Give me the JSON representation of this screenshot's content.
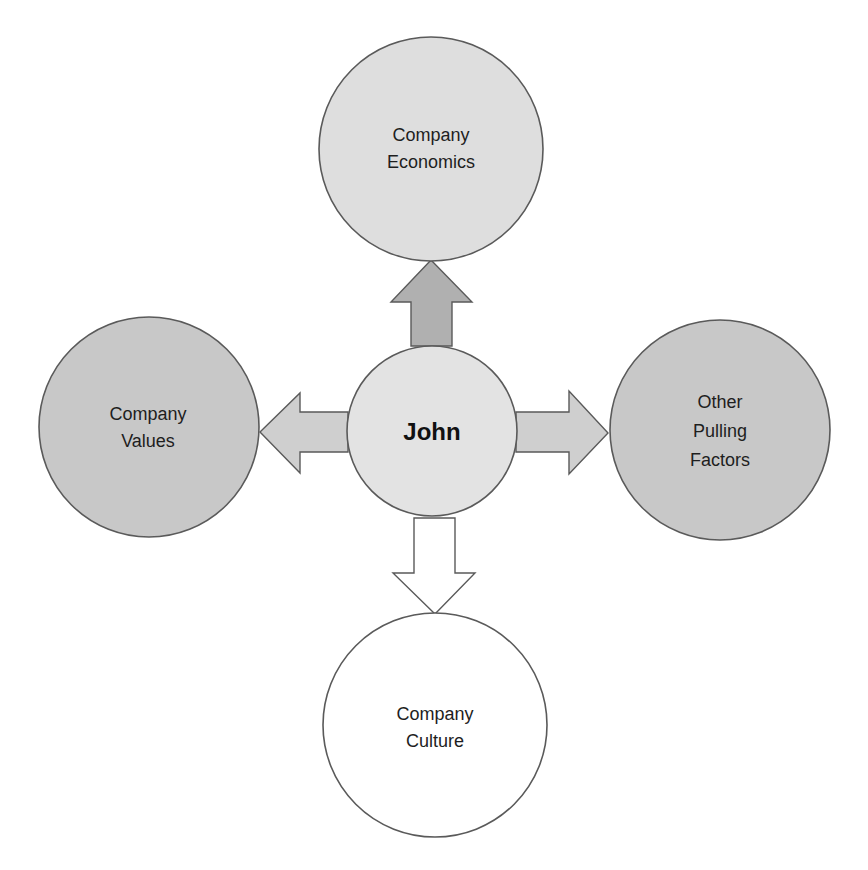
{
  "diagram": {
    "center": {
      "label": "John",
      "fill": "#e3e3e3"
    },
    "nodes": [
      {
        "id": "top",
        "lines": [
          "Company",
          "Economics"
        ],
        "fill": "#dedede"
      },
      {
        "id": "left",
        "lines": [
          "Company",
          "Values"
        ],
        "fill": "#c8c8c8"
      },
      {
        "id": "right",
        "lines": [
          "Other",
          "Pulling",
          "Factors"
        ],
        "fill": "#c8c8c8"
      },
      {
        "id": "bottom",
        "lines": [
          "Company",
          "Culture"
        ],
        "fill": "#ffffff"
      }
    ],
    "arrows": [
      {
        "direction": "up",
        "fill": "#b0b0b0"
      },
      {
        "direction": "left",
        "fill": "#cfcfcf"
      },
      {
        "direction": "right",
        "fill": "#cfcfcf"
      },
      {
        "direction": "down",
        "fill": "#ffffff"
      }
    ]
  }
}
